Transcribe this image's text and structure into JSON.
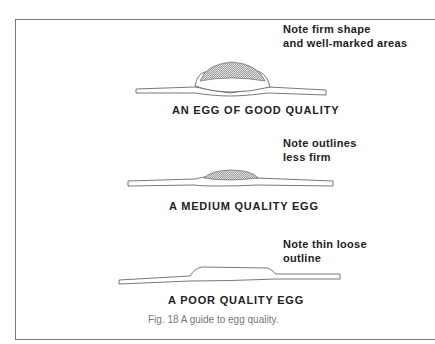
{
  "figure": {
    "sections": [
      {
        "note_line1": "Note firm shape",
        "note_line2": "and well-marked areas",
        "label": "AN EGG OF GOOD QUALITY"
      },
      {
        "note_line1": "Note outlines",
        "note_line2": "less firm",
        "label": "A MEDIUM  QUALITY EGG"
      },
      {
        "note_line1": "Note thin loose",
        "note_line2": "outline",
        "label": "A POOR QUALITY EGG"
      }
    ],
    "caption": "Fig. 18  A guide to egg quality."
  }
}
